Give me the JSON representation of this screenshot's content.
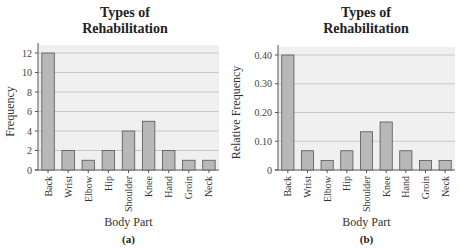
{
  "chart_data": [
    {
      "type": "bar",
      "panel_label": "(a)",
      "title_lines": [
        "Types of",
        "Rehabilitation"
      ],
      "xlabel": "Body Part",
      "ylabel": "Frequency",
      "categories": [
        "Back",
        "Wrist",
        "Elbow",
        "Hip",
        "Shoulder",
        "Knee",
        "Hand",
        "Groin",
        "Neck"
      ],
      "values": [
        12,
        2,
        1,
        2,
        4,
        5,
        2,
        1,
        1
      ],
      "ylim": [
        0,
        12
      ],
      "yticks": [
        0,
        2,
        4,
        6,
        8,
        10,
        12
      ],
      "ytick_labels": [
        "0",
        "2",
        "4",
        "6",
        "8",
        "10",
        "12"
      ],
      "grid": true,
      "colors": {
        "bar": "#b8b8b8",
        "bar_edge": "#555555",
        "plot_bg": "#f0f0f0",
        "grid": "#c8c8c8"
      }
    },
    {
      "type": "bar",
      "panel_label": "(b)",
      "title_lines": [
        "Types of",
        "Rehabilitation"
      ],
      "xlabel": "Body Part",
      "ylabel": "Relative Frequency",
      "categories": [
        "Back",
        "Wrist",
        "Elbow",
        "Hip",
        "Shoulder",
        "Knee",
        "Hand",
        "Groin",
        "Neck"
      ],
      "values": [
        0.4,
        0.067,
        0.033,
        0.067,
        0.133,
        0.167,
        0.067,
        0.033,
        0.033
      ],
      "ylim": [
        0,
        0.4
      ],
      "yticks": [
        0,
        0.1,
        0.2,
        0.3,
        0.4
      ],
      "ytick_labels": [
        "0",
        "0.10",
        "0.20",
        "0.30",
        "0.40"
      ],
      "grid": true,
      "colors": {
        "bar": "#b8b8b8",
        "bar_edge": "#555555",
        "plot_bg": "#f0f0f0",
        "grid": "#c8c8c8"
      }
    }
  ]
}
